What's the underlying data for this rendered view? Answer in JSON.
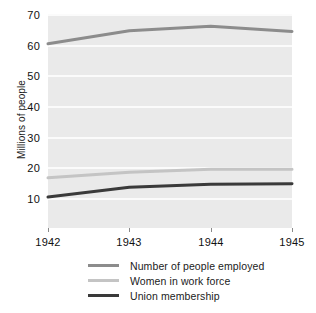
{
  "chart_data": {
    "type": "line",
    "title": "",
    "xlabel": "",
    "ylabel": "Millions of people",
    "x": [
      1942,
      1943,
      1944,
      1945
    ],
    "xticklabels": [
      "1942",
      "1943",
      "1944",
      "1945"
    ],
    "yticks": [
      10,
      20,
      30,
      40,
      50,
      60,
      70
    ],
    "yticklabels": [
      "10",
      "20",
      "30",
      "40",
      "50",
      "60",
      "70"
    ],
    "ylim": [
      5,
      73
    ],
    "xlim": [
      1942,
      1945
    ],
    "grid": true,
    "grid_axis": "y",
    "legend_position": "bottom",
    "plot_background": "#eaeaea",
    "gridline_color": "#fbfbfb",
    "series": [
      {
        "name": "Number of people employed",
        "color": "#8c8c8c",
        "width": 3,
        "values": [
          60.3,
          64.5,
          66.0,
          64.3
        ]
      },
      {
        "name": "Women in work force",
        "color": "#c4c4c4",
        "width": 3,
        "values": [
          16.5,
          18.3,
          19.3,
          19.3
        ]
      },
      {
        "name": "Union membership",
        "color": "#3a3a3a",
        "width": 3,
        "values": [
          10.2,
          13.4,
          14.4,
          14.6
        ]
      }
    ]
  }
}
